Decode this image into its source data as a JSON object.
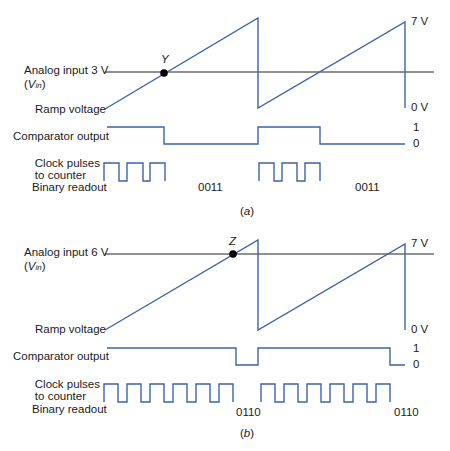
{
  "colors": {
    "signal": "#3d63a8",
    "reference": "#222222",
    "text": "#1a1a1a"
  },
  "panel_a": {
    "caption": "(a)",
    "caption_letter": "a",
    "analog_input_label": "Analog input 3 V",
    "vin_open": "(",
    "vin_symbol": "V",
    "vin_sub": "in",
    "vin_close": ")",
    "ramp_label": "Ramp voltage",
    "comparator_label": "Comparator output",
    "clock_label_line1": "Clock pulses",
    "clock_label_line2": "to counter",
    "binary_label": "Binary readout",
    "point_label": "Y",
    "v_max_label": "7 V",
    "v_min_label": "0 V",
    "logic_high_label": "1",
    "logic_low_label": "0",
    "readouts": [
      "0011",
      "0011"
    ],
    "clock_pulses_per_cycle": 3
  },
  "panel_b": {
    "caption": "(b)",
    "caption_letter": "b",
    "analog_input_label": "Analog input 6 V",
    "vin_open": "(",
    "vin_symbol": "V",
    "vin_sub": "in",
    "vin_close": ")",
    "ramp_label": "Ramp voltage",
    "comparator_label": "Comparator output",
    "clock_label_line1": "Clock pulses",
    "clock_label_line2": "to counter",
    "binary_label": "Binary readout",
    "point_label": "Z",
    "v_max_label": "7 V",
    "v_min_label": "0 V",
    "logic_high_label": "1",
    "logic_low_label": "0",
    "readouts": [
      "0110",
      "0110"
    ],
    "clock_pulses_per_cycle": 6
  }
}
